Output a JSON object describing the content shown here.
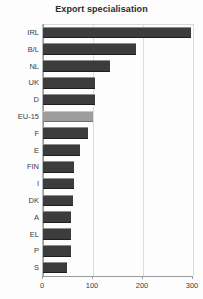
{
  "chart_data": {
    "type": "bar",
    "orientation": "horizontal",
    "title": "Export specialisation",
    "xlabel": "",
    "ylabel": "",
    "xlim": [
      0,
      300
    ],
    "ylim": null,
    "grid": true,
    "legend": null,
    "xticks": [
      0,
      100,
      200,
      300
    ],
    "xtick_labels": [
      "0",
      "100",
      "200",
      "300"
    ],
    "categories": [
      "IRL",
      "B/L",
      "NL",
      "UK",
      "D",
      "EU-15",
      "F",
      "E",
      "FIN",
      "I",
      "DK",
      "A",
      "EL",
      "P",
      "S"
    ],
    "values": [
      296,
      186,
      134,
      104,
      103,
      100,
      90,
      74,
      62,
      61,
      60,
      56,
      56,
      55,
      48
    ],
    "series": [
      {
        "name": "Export specialisation",
        "values": [
          296,
          186,
          134,
          104,
          103,
          100,
          90,
          74,
          62,
          61,
          60,
          56,
          56,
          55,
          48
        ]
      }
    ],
    "highlight_category": "EU-15",
    "colors": {
      "bar": "#3c3c3c",
      "bar_highlight": "#9d9d9d",
      "grid": "#dcdcdc",
      "axis": "#9a9a9a",
      "text": "#3a3a3a",
      "background": "#fdfdfd"
    }
  }
}
